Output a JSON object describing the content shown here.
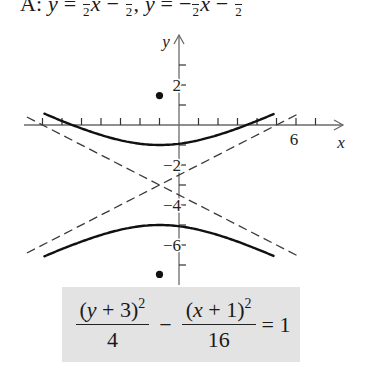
{
  "answer": {
    "prefix": "A:",
    "var_y": "y",
    "equals": "=",
    "minus": "−",
    "comma": ",",
    "var_x": "x",
    "den": "2",
    "text": "A: y = ½x − ½, y = −½x − ½"
  },
  "equation": {
    "num1_open": "(",
    "num1_var": "y",
    "num1_rest": " + 3)",
    "num1_exp": "2",
    "den1": "4",
    "minus": "−",
    "num2_open": "(",
    "num2_var": "x",
    "num2_rest": " + 1)",
    "num2_exp": "2",
    "den2": "16",
    "equals": "= 1",
    "text": "(y + 3)^2/4 − (x + 1)^2/16 = 1"
  },
  "chart_data": {
    "type": "line",
    "title": "",
    "xlabel": "x",
    "ylabel": "y",
    "xlim": [
      -8,
      8.5
    ],
    "ylim": [
      -8,
      4.5
    ],
    "grid": false,
    "x_ticks": [
      -7,
      -6,
      -5,
      -4,
      -3,
      -2,
      -1,
      1,
      2,
      3,
      4,
      5,
      6,
      7
    ],
    "x_tick_labels": [
      {
        "value": 6,
        "label": "6"
      }
    ],
    "y_ticks": [
      3,
      2,
      1,
      -1,
      -2,
      -3,
      -4,
      -5,
      -6,
      -7
    ],
    "y_tick_labels": [
      {
        "value": 2,
        "label": "2"
      },
      {
        "value": -2,
        "label": "−2"
      },
      {
        "value": -4,
        "label": "−4"
      },
      {
        "value": -6,
        "label": "−6"
      }
    ],
    "hyperbola": {
      "equation": "(y + 3)^2/4 - (x + 1)^2/16 = 1",
      "center": [
        -1,
        -3
      ],
      "a": 2,
      "b": 4,
      "orientation": "vertical",
      "vertices": [
        [
          -1,
          -1
        ],
        [
          -1,
          -5
        ]
      ],
      "x_range": [
        -6.9,
        4.85
      ]
    },
    "asymptotes": [
      {
        "equation": "y = 1/2 x - 5/2",
        "slope": 0.5,
        "intercept": -2.5,
        "x_range": [
          -7.8,
          6.1
        ],
        "style": "dashed"
      },
      {
        "equation": "y = -1/2 x - 7/2",
        "slope": -0.5,
        "intercept": -3.5,
        "x_range": [
          -7.8,
          6.1
        ],
        "style": "dashed"
      }
    ],
    "foci": [
      [
        -1,
        1.47
      ],
      [
        -1,
        -7.47
      ]
    ],
    "series": [
      {
        "name": "upper branch",
        "style": "solid"
      },
      {
        "name": "lower branch",
        "style": "solid"
      },
      {
        "name": "asymptote 1",
        "style": "dashed"
      },
      {
        "name": "asymptote 2",
        "style": "dashed"
      },
      {
        "name": "foci",
        "style": "points"
      }
    ]
  },
  "layout": {
    "origin_px": [
      179,
      125
    ],
    "unit_px_x": 19.5,
    "unit_px_y": 20,
    "x_axis_px": [
      24,
      343
    ],
    "y_axis_px": [
      35,
      285
    ]
  }
}
